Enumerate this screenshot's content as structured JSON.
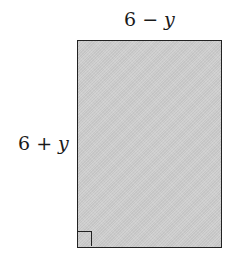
{
  "diagram": {
    "shape": "rectangle",
    "top_label": {
      "num": "6",
      "op": " − ",
      "var": "y"
    },
    "side_label": {
      "num": "6",
      "op": " + ",
      "var": "y"
    },
    "fill_color": "#cfcfcf",
    "stroke_color": "#222222",
    "right_angle_marker": true
  }
}
